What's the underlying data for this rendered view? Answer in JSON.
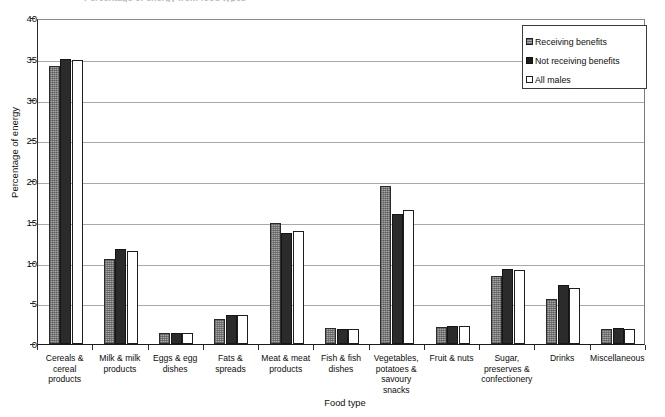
{
  "figure": {
    "title_remnant": "Percentage of energy from food types",
    "axis_title_x": "Food type",
    "axis_title_y": "Percentage of energy"
  },
  "legend": {
    "position": "top-right",
    "entries": [
      {
        "label": "Receiving benefits",
        "swatch": "gray-stippled-square-icon",
        "color": "#a8a8a8"
      },
      {
        "label": "Not receiving benefits",
        "swatch": "black-square-icon",
        "color": "#2b2b2b"
      },
      {
        "label": "All males",
        "swatch": "white-square-icon",
        "color": "#ffffff"
      }
    ]
  },
  "chart_data": {
    "type": "bar",
    "title": "",
    "xlabel": "Food type",
    "ylabel": "Percentage of energy",
    "ylim": [
      0,
      40
    ],
    "ytick_step": 5,
    "yticks": [
      0,
      5,
      10,
      15,
      20,
      25,
      30,
      35,
      40
    ],
    "grid": true,
    "grid_axis": "y",
    "legend_position": "top-right",
    "categories": [
      "Cereals & cereal products",
      "Milk & milk products",
      "Eggs & egg dishes",
      "Fats & spreads",
      "Meat & meat products",
      "Fish & fish dishes",
      "Vegetables, potatoes & savoury snacks",
      "Fruit & nuts",
      "Sugar, preserves & confectionery",
      "Drinks",
      "Miscellaneous"
    ],
    "category_lines": [
      [
        "Cereals &",
        "cereal",
        "products"
      ],
      [
        "Milk & milk",
        "products"
      ],
      [
        "Eggs & egg",
        "dishes"
      ],
      [
        "Fats &",
        "spreads"
      ],
      [
        "Meat & meat",
        "products"
      ],
      [
        "Fish & fish",
        "dishes"
      ],
      [
        "Vegetables,",
        "potatoes &",
        "savoury",
        "snacks"
      ],
      [
        "Fruit & nuts"
      ],
      [
        "Sugar,",
        "preserves &",
        "confectionery"
      ],
      [
        "Drinks"
      ],
      [
        "Miscellaneous"
      ]
    ],
    "series": [
      {
        "name": "Receiving benefits",
        "color": "#a8a8a8",
        "values": [
          34.1,
          10.4,
          1.3,
          3.1,
          14.9,
          2.0,
          19.4,
          2.1,
          8.3,
          5.5,
          1.8
        ]
      },
      {
        "name": "Not receiving benefits",
        "color": "#2b2b2b",
        "values": [
          35.0,
          11.7,
          1.4,
          3.6,
          13.6,
          1.8,
          15.9,
          2.2,
          9.2,
          7.2,
          2.0
        ]
      },
      {
        "name": "All males",
        "color": "#ffffff",
        "values": [
          34.8,
          11.4,
          1.3,
          3.5,
          13.9,
          1.9,
          16.5,
          2.2,
          9.1,
          6.9,
          1.9
        ]
      }
    ]
  }
}
